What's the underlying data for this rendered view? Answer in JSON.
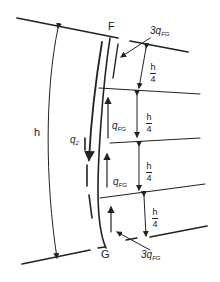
{
  "diagram": {
    "type": "structural shear flow diagram",
    "labels": {
      "top_node": "F",
      "bottom_node": "G",
      "height": "h",
      "left_flow": "q",
      "left_flow_sub": "2",
      "top_flow_coef": "3q",
      "top_flow_sub": "FG",
      "bottom_flow_coef": "3q",
      "bottom_flow_sub": "FG",
      "mid_flow_upper": "q",
      "mid_flow_upper_sub": "FG",
      "mid_flow_lower": "q",
      "mid_flow_lower_sub": "FG",
      "quarter_num": "h",
      "quarter_den": "4"
    },
    "segments": [
      {
        "name": "segment-1",
        "num": "h",
        "den": "4"
      },
      {
        "name": "segment-2",
        "num": "h",
        "den": "4"
      },
      {
        "name": "segment-3",
        "num": "h",
        "den": "4"
      },
      {
        "name": "segment-4",
        "num": "h",
        "den": "4"
      }
    ],
    "colors": {
      "ink": "#222222",
      "background": "#ffffff"
    }
  }
}
